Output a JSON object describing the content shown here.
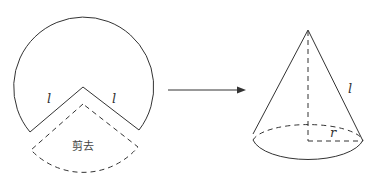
{
  "figure": {
    "sector_labels": {
      "left_slant": "l",
      "right_slant": "l",
      "cut_text": "剪去"
    },
    "cone_labels": {
      "slant": "l",
      "radius": "r"
    },
    "arrow": "right-arrow"
  }
}
